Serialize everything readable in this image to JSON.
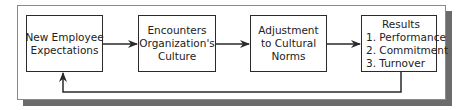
{
  "diagram": {
    "type": "flowchart",
    "direction": "left-to-right with feedback loop",
    "nodes": [
      {
        "id": "box1",
        "lines": [
          "New Employee",
          "Expectations"
        ]
      },
      {
        "id": "box2",
        "lines": [
          "Encounters",
          "Organization's",
          "Culture"
        ]
      },
      {
        "id": "box3",
        "lines": [
          "Adjustment",
          "to Cultural",
          "Norms"
        ]
      },
      {
        "id": "box4",
        "title": "Results",
        "items": [
          "1. Performance",
          "2. Commitment",
          "3. Turnover"
        ]
      }
    ],
    "edges": [
      {
        "from": "box1",
        "to": "box2"
      },
      {
        "from": "box2",
        "to": "box3"
      },
      {
        "from": "box3",
        "to": "box4"
      },
      {
        "from": "box4",
        "to": "box1",
        "kind": "feedback"
      }
    ],
    "colors": {
      "line": "#2a2a2a",
      "shadow": "#6b6b6b",
      "frame_border": "#8a8a8a",
      "background": "#ffffff"
    }
  }
}
